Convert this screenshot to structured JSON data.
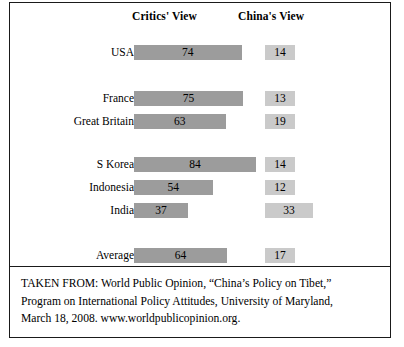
{
  "chart_data": {
    "type": "bar",
    "title": "",
    "subtitle": "",
    "xlabel": "",
    "ylabel": "",
    "orientation": "horizontal",
    "grid": false,
    "legend_position": "top-as-column-headers",
    "axis_range": [
      0,
      100
    ],
    "value_unit": "percent",
    "categories": [
      "USA",
      "France",
      "Great Britain",
      "S Korea",
      "Indonesia",
      "India",
      "Average"
    ],
    "series": [
      {
        "name": "Critics' View",
        "color": "#9c9c9c",
        "values": [
          74,
          75,
          63,
          84,
          54,
          37,
          64
        ]
      },
      {
        "name": "China's View",
        "color": "#cacaca",
        "values": [
          14,
          13,
          19,
          14,
          12,
          33,
          17
        ]
      }
    ],
    "groups": [
      {
        "rows": [
          "USA"
        ]
      },
      {
        "rows": [
          "France",
          "Great Britain"
        ]
      },
      {
        "rows": [
          "S Korea",
          "Indonesia",
          "India"
        ]
      },
      {
        "rows": [
          "Average"
        ]
      }
    ]
  },
  "header": {
    "critics_label": "Critics' View",
    "china_label": "China's View"
  },
  "rows": [
    {
      "label": "USA",
      "critics": "74",
      "china": "14",
      "critics_value": 74,
      "china_value": 14,
      "top": 16,
      "china_left": 131
    },
    {
      "label": "France",
      "critics": "75",
      "china": "13",
      "critics_value": 75,
      "china_value": 13,
      "top": 62,
      "china_left": 131
    },
    {
      "label": "Great Britain",
      "critics": "63",
      "china": "19",
      "critics_value": 63,
      "china_value": 19,
      "top": 85,
      "china_left": 131
    },
    {
      "label": "S Korea",
      "critics": "84",
      "china": "14",
      "critics_value": 84,
      "china_value": 14,
      "top": 128,
      "china_left": 131
    },
    {
      "label": "Indonesia",
      "critics": "54",
      "china": "12",
      "critics_value": 54,
      "china_value": 12,
      "top": 151,
      "china_left": 131
    },
    {
      "label": "India",
      "critics": "37",
      "china": "33",
      "critics_value": 37,
      "china_value": 33,
      "top": 174,
      "china_left": 131
    },
    {
      "label": "Average",
      "critics": "64",
      "china": "17",
      "critics_value": 64,
      "china_value": 17,
      "top": 219,
      "china_left": 131
    }
  ],
  "source": {
    "line1": "TAKEN FROM: World Public Opinion, “China’s Policy on Tibet,”",
    "line2": "Program on International Policy Attitudes, University of Maryland,",
    "line3": "March 18, 2008. www.worldpublicopinion.org."
  }
}
